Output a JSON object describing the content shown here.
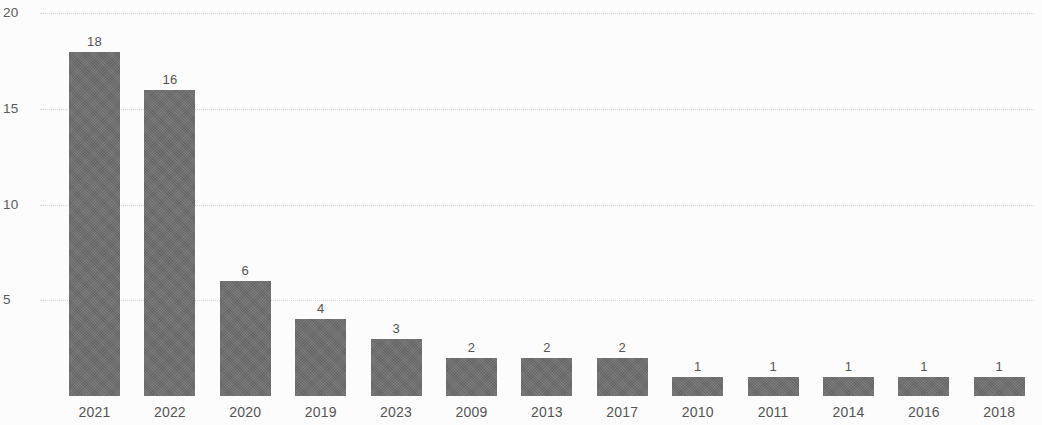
{
  "chart_data": {
    "type": "bar",
    "title": "",
    "subtitle": "",
    "xlabel": "",
    "ylabel": "",
    "categories": [
      "2021",
      "2022",
      "2020",
      "2019",
      "2023",
      "2009",
      "2013",
      "2017",
      "2010",
      "2011",
      "2014",
      "2016",
      "2018"
    ],
    "values": [
      18,
      16,
      6,
      4,
      3,
      2,
      2,
      2,
      1,
      1,
      1,
      1,
      1
    ],
    "data_labels": [
      "18",
      "16",
      "6",
      "4",
      "3",
      "2",
      "2",
      "2",
      "1",
      "1",
      "1",
      "1",
      "1"
    ],
    "ylim": [
      0,
      20
    ],
    "y_ticks": [
      5,
      10,
      15,
      20
    ],
    "y_tick_labels": [
      "5",
      "10",
      "15",
      "20"
    ],
    "grid": true,
    "grid_orientation": "horizontal",
    "grid_style": "dotted",
    "legend": false,
    "legend_position": "none",
    "bar_color": "#6f6f6f",
    "grid_color": "#d6d6d6",
    "text_color": "#565656",
    "background_color": "#fefefe",
    "series": [
      {
        "name": "count",
        "values": [
          18,
          16,
          6,
          4,
          3,
          2,
          2,
          2,
          1,
          1,
          1,
          1,
          1
        ]
      }
    ]
  },
  "layout": {
    "baseline_y": 396,
    "top_tick_y": 13,
    "pixels_per_unit": 19.13,
    "first_bar_left": 69,
    "bar_width": 51,
    "bar_pitch": 75.4,
    "category_label_y": 405,
    "value_label_offset": 17
  }
}
